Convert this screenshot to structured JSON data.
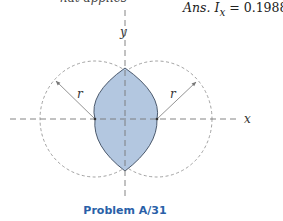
{
  "top_fragment": "hat applies",
  "answer": {
    "prefix": "Ans.",
    "symbol": "I",
    "subscript": "x",
    "equals": "=",
    "value": "0.1988",
    "variable": "r",
    "exponent": "4"
  },
  "figure": {
    "axis_x_label": "x",
    "axis_y_label": "y",
    "radius_label_left": "r",
    "radius_label_right": "r",
    "fill_color": "#b3c7e0",
    "outline_color": "#3b4a5e",
    "dashed_color": "#888888"
  },
  "caption": "Problem A/31"
}
